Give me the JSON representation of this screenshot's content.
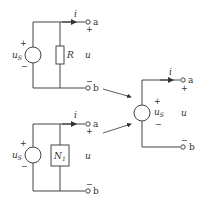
{
  "diagram": {
    "type": "circuit-equivalence",
    "circuits": [
      {
        "id": "top",
        "source_label": "u",
        "source_sub": "S",
        "source_plus": "+",
        "source_minus": "−",
        "element_label": "R",
        "current_label": "i",
        "voltage_label": "u",
        "terminal_a": "a",
        "terminal_b": "b",
        "plus": "+",
        "minus": "−"
      },
      {
        "id": "bottom",
        "source_label": "u",
        "source_sub": "S",
        "source_plus": "+",
        "source_minus": "−",
        "element_label": "N",
        "element_sub": "1",
        "current_label": "i",
        "voltage_label": "u",
        "terminal_a": "a",
        "terminal_b": "b",
        "plus": "+",
        "minus": "−"
      },
      {
        "id": "right",
        "source_label": "u",
        "source_sub": "S",
        "source_plus": "+",
        "source_minus": "−",
        "current_label": "i",
        "voltage_label": "u",
        "terminal_a": "a",
        "terminal_b": "b",
        "plus": "+",
        "minus": "−"
      }
    ],
    "colors": {
      "line": "#444444",
      "text": "#333333",
      "background": "#ffffff"
    }
  }
}
